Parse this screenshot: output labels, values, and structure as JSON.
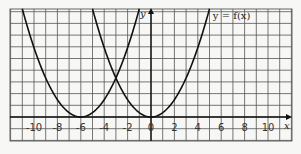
{
  "chart_data": {
    "type": "line",
    "title": "",
    "xlabel": "x",
    "ylabel": "y",
    "xlim": [
      -12,
      12
    ],
    "ylim": [
      -2,
      9.3
    ],
    "grid": true,
    "x_tick_labels": [
      "-10",
      "-8",
      "-6",
      "-4",
      "-2",
      "0",
      "2",
      "4",
      "6",
      "8",
      "10"
    ],
    "x_ticks": [
      -10,
      -8,
      -6,
      -4,
      -2,
      0,
      2,
      4,
      6,
      8,
      10
    ],
    "annotations": [
      {
        "text": "y = f(x)",
        "x": 5.2,
        "y": 8.6
      }
    ],
    "series": [
      {
        "name": "y = f(x)",
        "vertex": [
          0,
          0
        ],
        "x": [
          0,
          1,
          2,
          3,
          4,
          5
        ],
        "y": [
          0,
          0.37,
          1.48,
          3.33,
          5.92,
          9.25
        ]
      },
      {
        "name": "reflected curve",
        "vertex": [
          0,
          0
        ],
        "x": [
          -5,
          -4,
          -3,
          -2,
          -1,
          0
        ],
        "y": [
          9.25,
          5.92,
          3.33,
          1.48,
          0.37,
          0
        ]
      },
      {
        "name": "shifted curve",
        "vertex": [
          -6,
          0
        ],
        "x": [
          -11,
          -10,
          -9,
          -8,
          -7,
          -6,
          -5,
          -4,
          -3,
          -2,
          -1
        ],
        "y": [
          9.25,
          5.92,
          3.33,
          1.48,
          0.37,
          0,
          0.37,
          1.48,
          3.33,
          5.92,
          9.25
        ]
      }
    ]
  },
  "labels": {
    "x_axis": "x",
    "y_axis": "y",
    "curve": "y = f(x)"
  },
  "colors": {
    "grid": "#555555",
    "curve": "#111111",
    "background": "#f7f7f5"
  }
}
